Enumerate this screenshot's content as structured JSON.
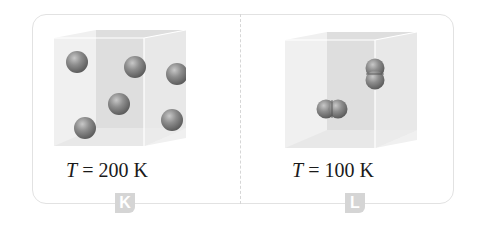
{
  "panels": [
    {
      "id": "K",
      "badge_label": "K",
      "caption_symbol": "T",
      "caption_rest": " = 200 K",
      "temperature_K": 200,
      "particle_type": "single atoms",
      "particle_count": 6
    },
    {
      "id": "L",
      "badge_label": "L",
      "caption_symbol": "T",
      "caption_rest": " = 100 K",
      "temperature_K": 100,
      "particle_type": "diatomic molecules",
      "particle_count": 2
    }
  ],
  "colors": {
    "frame": "#e2e2e2",
    "badge": "#d5d5d5",
    "sphere": "#8a8a8a",
    "box_face": "#e6e6e6"
  }
}
